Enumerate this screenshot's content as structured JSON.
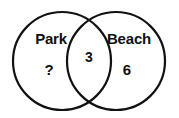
{
  "diagram": {
    "type": "venn-two-set",
    "background_color": "#ffffff",
    "stroke_color": "#111111",
    "text_color": "#111111",
    "left_set": {
      "name": "Park",
      "label": "Park",
      "value": "?"
    },
    "right_set": {
      "name": "Beach",
      "label": "Beach",
      "value": "6"
    },
    "intersection": {
      "name": "Park and Beach",
      "value": "3"
    }
  }
}
